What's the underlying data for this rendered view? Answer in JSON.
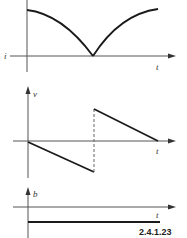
{
  "figure": {
    "caption": "2.4.1.23",
    "panels": [
      {
        "id": "current",
        "y_label": "i",
        "x_label": "t",
        "shape": "rectified-arc",
        "description": "Curve starts high, falls to zero at the midpoint forming a cusp, then rises back symmetrically"
      },
      {
        "id": "voltage",
        "y_label": "v",
        "x_label": "t",
        "shape": "sawtooth",
        "description": "Linear decrease from zero to negative minimum, vertical dashed jump to positive maximum, then linear decrease back to zero"
      },
      {
        "id": "b",
        "y_label": "b",
        "x_label": "t",
        "shape": "constant-negative",
        "description": "Constant horizontal line below the time axis"
      }
    ]
  },
  "colors": {
    "background": "#ffffff",
    "curve": "#1a1a1a",
    "axis": "#555555"
  }
}
